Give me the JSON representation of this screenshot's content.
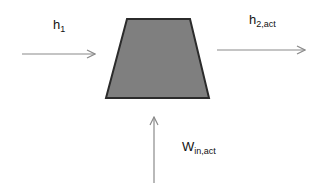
{
  "diagram": {
    "component": {
      "shape": "trapezoid",
      "fill": "#7f7f7f",
      "stroke": "#2b2b2b"
    },
    "inlet": {
      "symbol": "h",
      "subscript": "1"
    },
    "outlet": {
      "symbol": "h",
      "subscript": "2,act"
    },
    "work": {
      "symbol": "W",
      "subscript": "in,act"
    },
    "arrow_color": "#8a8a8a"
  }
}
